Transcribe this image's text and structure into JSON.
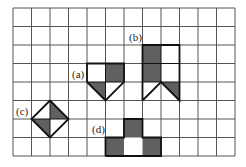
{
  "grid": {
    "cols": 12,
    "rows": 8,
    "left": 13,
    "top": 8,
    "cell": 18.5
  },
  "colors": {
    "fill": "#606060",
    "grid": "#555555",
    "outline": "#111111",
    "bg": "#ffffff"
  },
  "labels": {
    "a": "(a)",
    "b": "(b)",
    "c": "(c)",
    "d": "(d)"
  },
  "shapes": {
    "a": {
      "gray": [
        [
          [
            5,
            3
          ],
          [
            6,
            3
          ],
          [
            6,
            4
          ],
          [
            5,
            4
          ]
        ],
        [
          [
            4,
            4
          ],
          [
            5,
            4
          ],
          [
            5,
            5
          ]
        ]
      ],
      "outline": [
        [
          4,
          4
        ],
        [
          4,
          3
        ],
        [
          6,
          3
        ],
        [
          6,
          4
        ],
        [
          5,
          5
        ],
        [
          4,
          4
        ]
      ],
      "inner": [
        [
          [
            5,
            3
          ],
          [
            5,
            5
          ]
        ],
        [
          [
            4,
            4
          ],
          [
            6,
            4
          ]
        ]
      ]
    },
    "b": {
      "gray": [
        [
          [
            7,
            2
          ],
          [
            8,
            2
          ],
          [
            8,
            4
          ],
          [
            7,
            4
          ]
        ],
        [
          [
            8,
            4
          ],
          [
            9,
            4
          ],
          [
            9,
            5
          ]
        ]
      ],
      "outline": [
        [
          7,
          5
        ],
        [
          7,
          2
        ],
        [
          9,
          2
        ],
        [
          9,
          5
        ],
        [
          8,
          4
        ],
        [
          7,
          5
        ]
      ],
      "inner": [
        [
          [
            8,
            2
          ],
          [
            8,
            4
          ]
        ],
        [
          [
            7,
            3
          ],
          [
            9,
            3
          ]
        ],
        [
          [
            7,
            4
          ],
          [
            9,
            4
          ]
        ]
      ]
    },
    "c": {
      "gray": [
        [
          [
            2,
            5
          ],
          [
            3,
            6
          ],
          [
            2,
            6
          ]
        ],
        [
          [
            1,
            6
          ],
          [
            2,
            6
          ],
          [
            2,
            7
          ]
        ]
      ],
      "outline": [
        [
          2,
          5
        ],
        [
          3,
          6
        ],
        [
          2,
          7
        ],
        [
          1,
          6
        ],
        [
          2,
          5
        ]
      ],
      "inner": [
        [
          [
            2,
            5
          ],
          [
            2,
            7
          ]
        ],
        [
          [
            1,
            6
          ],
          [
            3,
            6
          ]
        ]
      ]
    },
    "d": {
      "gray": [
        [
          [
            6,
            6
          ],
          [
            7,
            6
          ],
          [
            7,
            7
          ],
          [
            6,
            7
          ]
        ],
        [
          [
            5,
            7
          ],
          [
            6,
            7
          ],
          [
            6,
            8
          ],
          [
            5,
            8
          ]
        ],
        [
          [
            7,
            7
          ],
          [
            8,
            7
          ],
          [
            8,
            8
          ],
          [
            7,
            8
          ]
        ]
      ],
      "outline": [
        [
          5,
          8
        ],
        [
          5,
          7
        ],
        [
          6,
          7
        ],
        [
          6,
          6
        ],
        [
          7,
          6
        ],
        [
          7,
          7
        ],
        [
          8,
          7
        ],
        [
          8,
          8
        ],
        [
          5,
          8
        ]
      ],
      "inner": []
    }
  },
  "label_positions": {
    "a": [
      72,
      78
    ],
    "b": [
      129,
      41
    ],
    "c": [
      16,
      115
    ],
    "d": [
      92,
      133
    ]
  }
}
